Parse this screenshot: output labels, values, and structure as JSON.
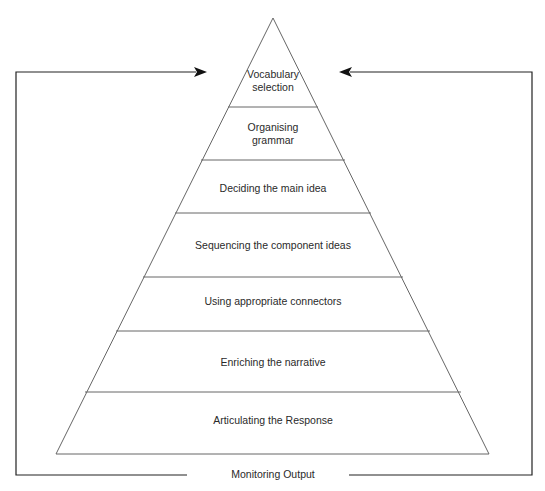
{
  "diagram": {
    "type": "pyramid-with-feedback-loop",
    "layers_top_to_bottom": [
      {
        "line1": "Vocabulary",
        "line2": "selection"
      },
      {
        "line1": "Organising",
        "line2": "grammar"
      },
      {
        "line1": "Deciding the main idea",
        "line2": ""
      },
      {
        "line1": "Sequencing the component ideas",
        "line2": ""
      },
      {
        "line1": "Using appropriate connectors",
        "line2": ""
      },
      {
        "line1": "Enriching the narrative",
        "line2": ""
      },
      {
        "line1": "Articulating the Response",
        "line2": ""
      }
    ],
    "feedback_label": "Monitoring Output",
    "colors": {
      "stroke": "#555555",
      "arrow": "#111111",
      "text": "#2a2a2a"
    }
  }
}
